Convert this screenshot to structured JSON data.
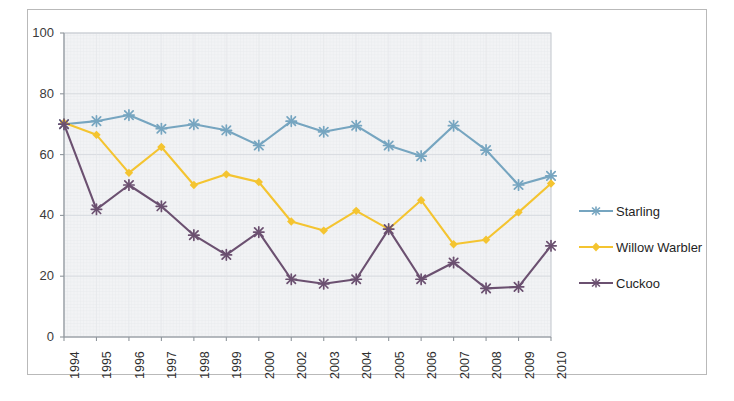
{
  "chart_data": {
    "type": "line",
    "title": "",
    "subtitle": "",
    "xlabel": "",
    "ylabel": "",
    "categories": [
      "1994",
      "1995",
      "1996",
      "1997",
      "1998",
      "1999",
      "2000",
      "2002",
      "2003",
      "2004",
      "2005",
      "2006",
      "2007",
      "2008",
      "2009",
      "2010"
    ],
    "ylim": [
      0,
      100
    ],
    "yticks": [
      "0",
      "20",
      "40",
      "60",
      "80",
      "100"
    ],
    "ytick_values": [
      0,
      20,
      40,
      60,
      80,
      100
    ],
    "grid": true,
    "legend_position": "right",
    "series": [
      {
        "name": "Starling",
        "color": "#76A5C0",
        "marker": "x-star",
        "values": [
          70,
          71,
          73,
          68.5,
          70,
          68,
          63,
          71,
          67.5,
          69.5,
          63,
          59.5,
          69.5,
          61.5,
          50,
          53
        ]
      },
      {
        "name": "Willow Warbler",
        "color": "#F4C430",
        "marker": "diamond",
        "values": [
          70.5,
          66.5,
          54,
          62.5,
          50,
          53.5,
          51,
          38,
          35,
          41.5,
          35.5,
          45,
          30.5,
          32,
          41,
          50.5
        ]
      },
      {
        "name": "Cuckoo",
        "color": "#6B5070",
        "marker": "x-star",
        "values": [
          70,
          42,
          50,
          43,
          33.5,
          27,
          34.5,
          19,
          17.5,
          19,
          35.5,
          19,
          24.5,
          16,
          16.5,
          30
        ]
      }
    ]
  },
  "legend": {
    "items": [
      {
        "label": "Starling",
        "color": "#76A5C0"
      },
      {
        "label": "Willow Warbler",
        "color": "#F4C430"
      },
      {
        "label": "Cuckoo",
        "color": "#6B5070"
      }
    ]
  },
  "axes": {
    "y_tick_labels": [
      "100",
      "80",
      "60",
      "40",
      "20",
      "0"
    ],
    "x_tick_labels": [
      "1994",
      "1995",
      "1996",
      "1997",
      "1998",
      "1999",
      "2000",
      "2002",
      "2003",
      "2004",
      "2005",
      "2006",
      "2007",
      "2008",
      "2009",
      "2010"
    ]
  },
  "colors": {
    "plot_background": "#f2f3f5",
    "grid_minor": "#e3e5ea",
    "grid_major": "#d7dade",
    "axis_line": "#9aa0a6",
    "frame": "#b9b9b9",
    "text": "#2f2f2f"
  }
}
